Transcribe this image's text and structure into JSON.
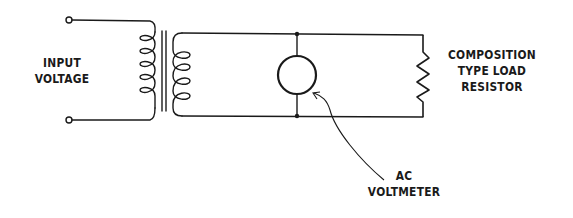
{
  "diagram": {
    "type": "circuit-schematic",
    "stroke_color": "#1a1a1a",
    "background": "#ffffff",
    "labels": {
      "input": [
        "INPUT",
        "VOLTAGE"
      ],
      "load": [
        "COMPOSITION",
        "TYPE LOAD",
        "RESISTOR"
      ],
      "meter": [
        "AC",
        "VOLTMETER"
      ]
    },
    "components": [
      {
        "id": "input-terminals",
        "kind": "terminal-pair",
        "count": 2
      },
      {
        "id": "transformer",
        "kind": "transformer",
        "primary_turns": 5,
        "secondary_turns": 4,
        "core": "iron (two parallel lines)"
      },
      {
        "id": "ac-voltmeter",
        "kind": "meter",
        "connection": "parallel"
      },
      {
        "id": "load-resistor",
        "kind": "resistor",
        "connection": "parallel"
      }
    ],
    "junctions": 2
  }
}
